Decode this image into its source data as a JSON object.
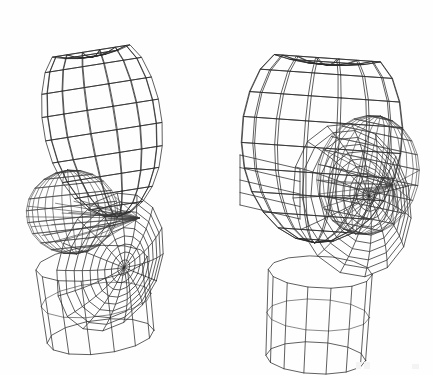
{
  "figure": {
    "background_color": "#fefefe",
    "line_color": "#2b2b2b",
    "width": 433,
    "height": 375,
    "view_count": 2,
    "render_style": "hidden-line-off wireframe",
    "models": [
      {
        "name": "head-left-rear-view",
        "label": "left figure",
        "orientation": "rear three-quarter, tilted",
        "center_x": 100,
        "center_y": 190,
        "skull": {
          "cx": 102,
          "cy": 120,
          "rx": 58,
          "ry": 98,
          "tilt_deg": -9,
          "u_divisions": 14,
          "v_divisions": 13,
          "flat_top_fraction": 0.16
        },
        "neck": {
          "cx": 96,
          "cy": 300,
          "rx": 56,
          "ry": 17,
          "height": 74,
          "tilt_deg": -7,
          "segments": 14
        },
        "face_ball": {
          "cx": 72,
          "cy": 212,
          "rx": 45,
          "ry": 42,
          "tilt_deg": -6,
          "u_divisions": 15,
          "v_divisions": 11
        },
        "face_disc": {
          "cx": 110,
          "cy": 262,
          "rx": 50,
          "ry": 72,
          "tilt_deg": 22,
          "u_divisions": 16,
          "v_divisions": 9
        },
        "converge_point": {
          "x": 139,
          "y": 218
        }
      },
      {
        "name": "head-right-side-view",
        "label": "right figure",
        "orientation": "left profile three-quarter",
        "center_x": 322,
        "center_y": 180,
        "skull": {
          "cx": 322,
          "cy": 135,
          "rx": 80,
          "ry": 108,
          "tilt_deg": 4,
          "u_divisions": 16,
          "v_divisions": 13,
          "flat_top_fraction": 0.14
        },
        "neck": {
          "cx": 318,
          "cy": 315,
          "rx": 52,
          "ry": 16,
          "height": 86,
          "tilt_deg": 3,
          "segments": 14
        },
        "face_ball": {
          "cx": 368,
          "cy": 175,
          "rx": 50,
          "ry": 60,
          "tilt_deg": 12,
          "u_divisions": 15,
          "v_divisions": 12
        },
        "face_disc": {
          "cx": 352,
          "cy": 200,
          "rx": 58,
          "ry": 78,
          "tilt_deg": -14,
          "u_divisions": 15,
          "v_divisions": 10
        },
        "jaw_panel": {
          "x1": 240,
          "y1": 155,
          "x2": 300,
          "y2": 205,
          "rows": 4
        },
        "converge_point": {
          "x": 392,
          "y": 185
        }
      }
    ],
    "scan_artifacts": [
      {
        "x": 356,
        "y": 362,
        "w": 5,
        "h": 7
      },
      {
        "x": 364,
        "y": 362,
        "w": 6,
        "h": 7
      },
      {
        "x": 412,
        "y": 364,
        "w": 7,
        "h": 5
      }
    ]
  }
}
